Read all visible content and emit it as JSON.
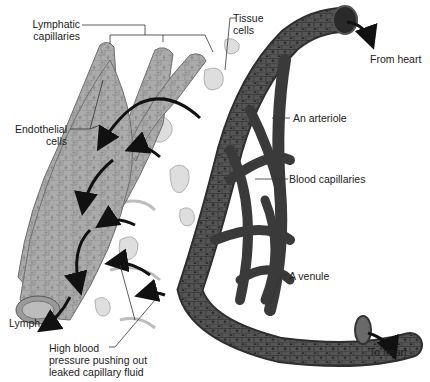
{
  "diagram": {
    "colors": {
      "background": "#ffffff",
      "lymphatic_fill": "#a9a9a9",
      "lymphatic_cell": "#8a8a8a",
      "blood_vessel": "#4a4a4a",
      "blood_vessel_dark": "#2e2e2e",
      "tissue_cell": "#d9d9d9",
      "arrow": "#111111",
      "leader_line": "#333333",
      "text": "#222222"
    },
    "labels": {
      "lymphatic_capillaries_line1": "Lymphatic",
      "lymphatic_capillaries_line2": "capillaries",
      "tissue_cells_line1": "Tissue",
      "tissue_cells_line2": "cells",
      "from_heart": "From heart",
      "endothelial_cells_line1": "Endothelial",
      "endothelial_cells_line2": "cells",
      "arteriole": "An arteriole",
      "blood_capillaries": "Blood capillaries",
      "venule": "A venule",
      "lymph": "Lymph",
      "to_heart": "To heart",
      "pressure_line1": "High blood",
      "pressure_line2": "pressure pushing out",
      "pressure_line3": "leaked capillary fluid"
    }
  }
}
